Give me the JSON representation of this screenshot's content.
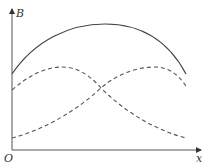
{
  "figure": {
    "y_axis_label": "B",
    "x_axis_label": "x",
    "origin_label": "O",
    "colors": {
      "axis": "#555555",
      "solid_curve": "#444444",
      "dashed_curve": "#555555"
    },
    "curves": [
      {
        "name": "total-field",
        "style": "solid",
        "description": "sum curve, hump shape"
      },
      {
        "name": "left-source-field",
        "style": "dashed",
        "description": "peaks left, decreases to right"
      },
      {
        "name": "right-source-field",
        "style": "dashed",
        "description": "rises from left, peaks right"
      }
    ]
  }
}
